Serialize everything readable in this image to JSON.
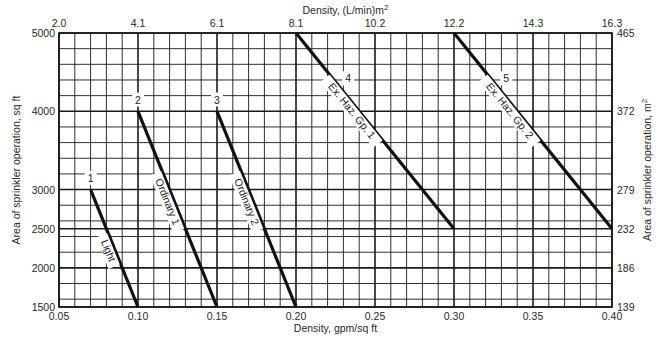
{
  "chart_data": {
    "type": "line",
    "title": "",
    "xlabel": "Density, gpm/sq ft",
    "ylabel": "Area of sprinkler operation, sq ft",
    "x2label": "Density, (L/min)m",
    "x2label_sup": "2",
    "y2label": "Area of sprinkler operation, m",
    "y2label_sup": "2",
    "xlim": [
      0.05,
      0.4
    ],
    "ylim": [
      1500,
      5000
    ],
    "grid": true,
    "legend": "none (inline curve labels)",
    "x_ticks": [
      "0.05",
      "0.10",
      "0.15",
      "0.20",
      "0.25",
      "0.30",
      "0.35",
      "0.40"
    ],
    "x_tick_values": [
      0.05,
      0.1,
      0.15,
      0.2,
      0.25,
      0.3,
      0.35,
      0.4
    ],
    "y_ticks": [
      "1500",
      "2000",
      "2500",
      "3000",
      "4000",
      "5000"
    ],
    "y_tick_values": [
      1500,
      2000,
      2500,
      3000,
      4000,
      5000
    ],
    "x2_ticks": [
      "2.0",
      "4.1",
      "6.1",
      "8.1",
      "10.2",
      "12.2",
      "14.3",
      "16.3"
    ],
    "y2_ticks": [
      "139",
      "186",
      "232",
      "279",
      "372",
      "465"
    ],
    "series": [
      {
        "id": "1",
        "name": "Light",
        "x": [
          0.07,
          0.1
        ],
        "y": [
          3000,
          1500
        ]
      },
      {
        "id": "2",
        "name": "Ordinary 1",
        "x": [
          0.1,
          0.15
        ],
        "y": [
          4000,
          1500
        ]
      },
      {
        "id": "3",
        "name": "Ordinary 2",
        "x": [
          0.15,
          0.2
        ],
        "y": [
          4000,
          1500
        ]
      },
      {
        "id": "4",
        "name": "Ex. Haz. Gp. 1",
        "x": [
          0.2,
          0.3
        ],
        "y": [
          5000,
          2500
        ]
      },
      {
        "id": "5",
        "name": "Ex. Haz. Gp. 2",
        "x": [
          0.3,
          0.4
        ],
        "y": [
          5000,
          2500
        ]
      }
    ]
  },
  "colors": {
    "grid": "#1a1a1a",
    "curve": "#111111",
    "text": "#2a2a2a",
    "background": "#ffffff"
  }
}
